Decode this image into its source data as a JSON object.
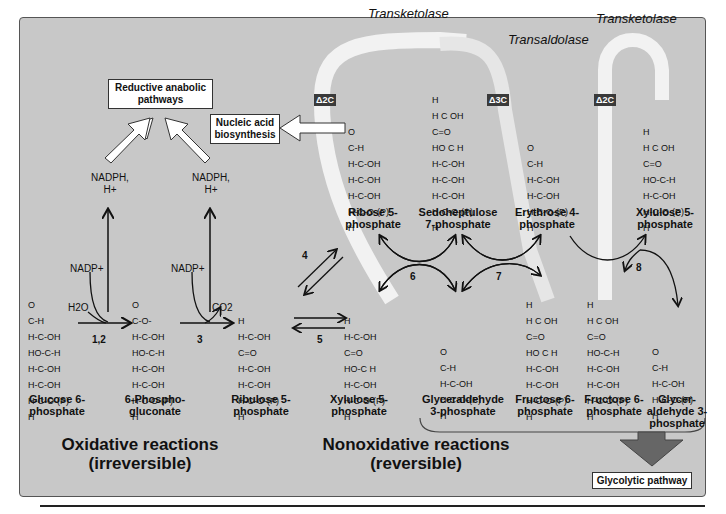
{
  "enzymes": {
    "transketolase_1": "Transketolase",
    "transaldolase": "Transaldolase",
    "transketolase_2": "Transketolase"
  },
  "deltas": [
    "Δ2C",
    "Δ3C",
    "Δ2C"
  ],
  "boxes": {
    "reductive": "Reductive anabolic pathways",
    "nucleic": "Nucleic acid biosynthesis",
    "glycolytic": "Glycolytic pathway"
  },
  "cofactors": {
    "nadph_1": "NADPH, H+",
    "nadph_2": "NADPH, H+",
    "nadp_1": "NADP+",
    "nadp_2": "NADP+",
    "h2o": "H2O",
    "co2": "CO2"
  },
  "reaction_numbers": {
    "r12": "1,2",
    "r3": "3",
    "r4": "4",
    "r5": "5",
    "r6": "6",
    "r7": "7",
    "r8": "8"
  },
  "molecules": {
    "glucose6p": "Glucose 6-phosphate",
    "phosphogluconate": "6-Phospho-gluconate",
    "ribulose5p": "Ribulose 5-phosphate",
    "ribose5p": "Ribose 5-phosphate",
    "sedoheptulose7p": "Sedoheptulose 7-phosphate",
    "erythrose4p": "Erythrose 4-phosphate",
    "xylulose5p_top": "Xylulose 5-phosphate",
    "xylulose5p_bottom": "Xylulose 5-phosphate",
    "glyceraldehyde3p_1": "Glyceraldehyde 3-phosphate",
    "fructose6p_1": "Fructose 6-phosphate",
    "fructose6p_2": "Fructose 6-phosphate",
    "glyceraldehyde3p_2": "Glycer-aldehyde 3-phosphate"
  },
  "sections": {
    "oxidative_title": "Oxidative reactions",
    "oxidative_sub": "(irreversible)",
    "nonoxidative_title": "Nonoxidative reactions",
    "nonoxidative_sub": "(reversible)"
  },
  "structures": {
    "glucose6p": [
      "O",
      "C-H",
      "H-C-OH",
      "HO-C-H",
      "H-C-OH",
      "H-C-OH",
      "H-C-O-(P)",
      "H"
    ],
    "phosphogluconate": [
      "O",
      "C-O-",
      "H-C-OH",
      "HO-C-H",
      "H-C-OH",
      "H-C-OH",
      "H-C-O-(P)",
      "H"
    ],
    "ribulose5p": [
      "H",
      "H-C-OH",
      "C=O",
      "H-C-OH",
      "H-C-OH",
      "H-C-O-(P)",
      "H"
    ],
    "ribose5p": [
      "O",
      "C-H",
      "H-C-OH",
      "H-C-OH",
      "H-C-OH",
      "H-C-O-(P)",
      "H"
    ],
    "sedoheptulose7p": [
      "H",
      "H C OH",
      "C=O",
      "HO C H",
      "H-C-OH",
      "H-C-OH",
      "H-C-OH",
      "H-C-O-(P)",
      "H"
    ],
    "erythrose4p": [
      "O",
      "C-H",
      "H-C-OH",
      "H-C-OH",
      "H-C-O-(P)",
      "H"
    ],
    "xylulose5p_top": [
      "H",
      "H C OH",
      "C=O",
      "HO-C-H",
      "H-C-OH",
      "H-C-O-(P)",
      "H"
    ],
    "xylulose5p_bottom": [
      "H",
      "H-C-OH",
      "C=O",
      "HO-C H",
      "H-C-OH",
      "H-C-O-(P)",
      "H"
    ],
    "glyceraldehyde3p_1": [
      "O",
      "C-H",
      "H-C-OH",
      "H-C-O-(P)",
      "H"
    ],
    "fructose6p_1": [
      "H",
      "H C OH",
      "C=O",
      "HO C H",
      "H-C-OH",
      "H-C-OH",
      "H-C-O-(P)",
      "H"
    ],
    "fructose6p_2": [
      "H",
      "H C OH",
      "C=O",
      "HO-C-H",
      "H-C-OH",
      "H-C-OH",
      "H-C-O-(P)",
      "H"
    ],
    "glyceraldehyde3p_2": [
      "O",
      "C-H",
      "H-C-OH",
      "H-C-O-(P)",
      "H"
    ]
  },
  "colors": {
    "panel": "#c8c8c8",
    "band": "#f2f2f2",
    "delta_bg": "#3a3a3a",
    "glycolytic_arrow": "#666666"
  }
}
